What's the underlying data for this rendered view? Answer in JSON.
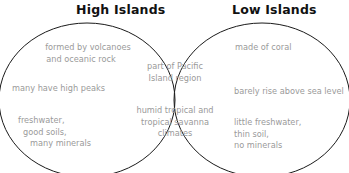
{
  "diagram": {
    "type": "venn",
    "left": {
      "title": "High Islands",
      "items": [
        {
          "lines": [
            "formed by volcanoes",
            "and oceanic rock"
          ]
        },
        {
          "lines": [
            "many have high peaks"
          ]
        },
        {
          "lines": [
            "freshwater,",
            "good soils,",
            "many minerals"
          ]
        }
      ]
    },
    "right": {
      "title": "Low Islands",
      "items": [
        {
          "lines": [
            "made of coral"
          ]
        },
        {
          "lines": [
            "barely rise above sea level"
          ]
        },
        {
          "lines": [
            "little freshwater,",
            "thin soil,",
            "no minerals"
          ]
        }
      ]
    },
    "overlap": {
      "items": [
        {
          "lines": [
            "part of Pacific",
            "Island region"
          ]
        },
        {
          "lines": [
            "humid tropical and",
            "tropical savanna",
            "climates"
          ]
        }
      ]
    },
    "colors": {
      "outline": "#1a1a1a",
      "title": "#111111",
      "item_text": "#9a9a9a"
    }
  }
}
